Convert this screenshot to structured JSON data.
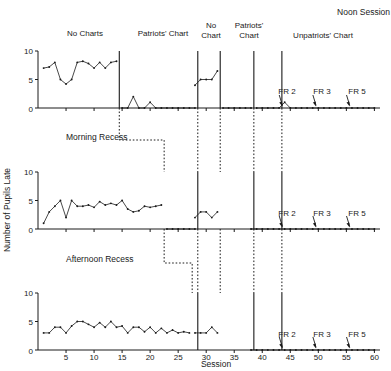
{
  "chart_data": {
    "type": "line",
    "title": "",
    "xlabel": "Session",
    "ylabel": "Number of Pupils Late",
    "xlim": [
      0,
      61
    ],
    "ylim": [
      0,
      10
    ],
    "xticks": [
      5,
      10,
      15,
      20,
      25,
      30,
      35,
      40,
      45,
      50,
      55,
      60
    ],
    "yticks": [
      0,
      5,
      10
    ],
    "grid": false,
    "legend_position": "none",
    "top_annotation": "Noon Session",
    "phase_labels": [
      {
        "text": "No Charts",
        "x_center": 7.5
      },
      {
        "text": "Patriots' Chart",
        "x_center": 20.5
      },
      {
        "text": "No Chart",
        "x_center": 30.0
      },
      {
        "text": "Patriots' Chart",
        "x_center": 35.0
      },
      {
        "text": "Unpatriots' Chart",
        "x_center": 50.0
      }
    ],
    "phase_boundaries": [
      14,
      28,
      32,
      38,
      43
    ],
    "fr_annotations": [
      {
        "label": "FR 2",
        "x": 43
      },
      {
        "label": "FR 3",
        "x": 49
      },
      {
        "label": "FR 5",
        "x": 55
      }
    ],
    "panels": [
      {
        "name": "Noon Session",
        "panel_label": "",
        "series": [
          {
            "name": "No Charts",
            "x": [
              1,
              2,
              3,
              4,
              5,
              6,
              7,
              8,
              9,
              10,
              11,
              12,
              13,
              14
            ],
            "values": [
              7,
              7.2,
              8,
              5,
              4.2,
              5,
              8,
              8.2,
              7.8,
              7,
              8,
              7,
              8,
              8.2,
              7,
              6.8,
              8.2
            ]
          },
          {
            "name": "Patriots' Chart",
            "x": [
              15,
              16,
              17,
              18,
              19,
              20,
              21,
              22,
              23,
              24,
              25,
              26,
              27,
              28
            ],
            "values": [
              0,
              0,
              2,
              0,
              0,
              1,
              0,
              0,
              0,
              0,
              0,
              0,
              0,
              0
            ]
          },
          {
            "name": "No Chart",
            "x": [
              28,
              29,
              30,
              31,
              32
            ],
            "values": [
              4,
              5,
              5,
              5,
              6.5
            ]
          },
          {
            "name": "Patriots' Chart 2",
            "x": [
              33,
              34,
              35,
              36,
              37,
              38
            ],
            "values": [
              0,
              0,
              0,
              0,
              0,
              0
            ]
          },
          {
            "name": "Unpatriots' Chart",
            "x": [
              39,
              40,
              41,
              42,
              43,
              44,
              45,
              46,
              47,
              48,
              49,
              50,
              51,
              52,
              53,
              54,
              55,
              56,
              57,
              58,
              59,
              60
            ],
            "values": [
              0,
              0,
              0,
              0,
              0,
              1,
              0,
              0,
              0,
              0,
              0,
              0,
              0,
              0,
              0,
              0,
              0,
              0,
              0,
              0,
              0,
              0
            ]
          }
        ]
      },
      {
        "name": "Morning Recess",
        "panel_label": "Morning Recess",
        "series": [
          {
            "name": "No Charts + Patriots' Chart",
            "x": [
              1,
              2,
              3,
              4,
              5,
              6,
              7,
              8,
              9,
              10,
              11,
              12,
              13,
              14,
              15,
              16,
              17,
              18,
              19,
              20,
              21,
              22
            ],
            "values": [
              1,
              3,
              4,
              5,
              2,
              5,
              4,
              4,
              4.2,
              3.8,
              4.8,
              4.2,
              4.5,
              4.2,
              5,
              3.5,
              3,
              3.2,
              4,
              3.8,
              4,
              4.2
            ]
          },
          {
            "name": "Baseline zero",
            "x": [
              23,
              24,
              25,
              26,
              27,
              28
            ],
            "values": [
              0,
              0,
              0,
              0,
              0,
              0
            ]
          },
          {
            "name": "No Chart",
            "x": [
              28,
              29,
              30,
              31,
              32
            ],
            "values": [
              2,
              3,
              3,
              2,
              3
            ]
          },
          {
            "name": "Unpatriots' Chart",
            "x": [
              38,
              39,
              40,
              41,
              42,
              43,
              44,
              45,
              46,
              47,
              48,
              49,
              50,
              51,
              52,
              53,
              54,
              55,
              56,
              57,
              58,
              59,
              60
            ],
            "values": [
              0,
              0,
              0,
              0,
              0,
              0,
              0,
              0,
              0,
              0,
              0,
              0,
              0,
              0,
              0,
              0,
              0,
              0,
              0,
              0,
              0,
              0,
              0
            ]
          }
        ]
      },
      {
        "name": "Afternoon Recess",
        "panel_label": "Afternoon Recess",
        "series": [
          {
            "name": "No Charts + Patriots' Chart",
            "x": [
              1,
              2,
              3,
              4,
              5,
              6,
              7,
              8,
              9,
              10,
              11,
              12,
              13,
              14,
              15,
              16,
              17,
              18,
              19,
              20,
              21,
              22,
              23,
              24,
              25,
              26,
              27
            ],
            "values": [
              3,
              3,
              4,
              4,
              3,
              4.2,
              5,
              5,
              4.5,
              4,
              4.8,
              4,
              5,
              4,
              4.2,
              3,
              4,
              4,
              3.2,
              4,
              3,
              3.8,
              3,
              3.5,
              3,
              3.2,
              3
            ]
          },
          {
            "name": "No Chart",
            "x": [
              28,
              29,
              30,
              31,
              32
            ],
            "values": [
              3,
              3,
              3,
              4,
              3
            ]
          },
          {
            "name": "Unpatriots' Chart",
            "x": [
              38,
              39,
              40,
              41,
              42,
              43,
              44,
              45,
              46,
              47,
              48,
              49,
              50,
              51,
              52,
              53,
              54,
              55,
              56,
              57,
              58,
              59,
              60
            ],
            "values": [
              0,
              0,
              0,
              0,
              0,
              0,
              0,
              0,
              0,
              0,
              0,
              0,
              0,
              0,
              0,
              0,
              0,
              0,
              0,
              0,
              0,
              0,
              0
            ]
          }
        ]
      }
    ]
  },
  "axis": {
    "y_label": "Number of Pupils Late",
    "x_label": "Session",
    "y_tick_0": "0",
    "y_tick_5": "5",
    "y_tick_10": "10",
    "x_tick_5": "5",
    "x_tick_10": "10",
    "x_tick_15": "15",
    "x_tick_20": "20",
    "x_tick_25": "25",
    "x_tick_30": "30",
    "x_tick_35": "35",
    "x_tick_40": "40",
    "x_tick_45": "45",
    "x_tick_50": "50",
    "x_tick_55": "55",
    "x_tick_60": "60"
  },
  "labels": {
    "noon_session": "Noon Session",
    "no_charts": "No Charts",
    "patriots_chart": "Patriots' Chart",
    "no_chart": "No Chart",
    "no_chart_l1": "No",
    "no_chart_l2": "Chart",
    "patriots_chart_l1": "Patriots'",
    "patriots_chart_l2": "Chart",
    "unpatriots_chart": "Unpatriots' Chart",
    "morning_recess": "Morning Recess",
    "afternoon_recess": "Afternoon Recess",
    "fr2": "FR 2",
    "fr3": "FR 3",
    "fr5": "FR 5"
  },
  "colors": {
    "ink": "#1a1a1a",
    "background": "#ffffff"
  }
}
